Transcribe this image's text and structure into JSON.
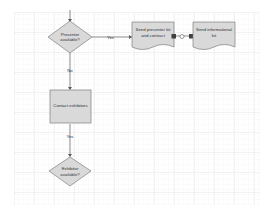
{
  "diagram": {
    "type": "flowchart",
    "nodes": [
      {
        "id": "presenter_available",
        "shape": "decision",
        "label_lines": [
          "Presenter",
          "available?"
        ]
      },
      {
        "id": "send_presenter_kit",
        "shape": "document",
        "label_lines": [
          "Send presenter kit",
          "and contract"
        ]
      },
      {
        "id": "send_informational_kit",
        "shape": "document",
        "label_lines": [
          "Send informational",
          "kit"
        ]
      },
      {
        "id": "contact_exhibitors",
        "shape": "process",
        "label_lines": [
          "Contact exhibitors"
        ]
      },
      {
        "id": "exhibitor_available",
        "shape": "decision",
        "label_lines": [
          "Exhibitor",
          "available?"
        ]
      }
    ],
    "edges": [
      {
        "from": "presenter_available",
        "to": "send_presenter_kit",
        "label": "Yes"
      },
      {
        "from": "send_presenter_kit",
        "to": "send_informational_kit",
        "label": ""
      },
      {
        "from": "presenter_available",
        "to": "contact_exhibitors",
        "label": "No"
      },
      {
        "from": "contact_exhibitors",
        "to": "exhibitor_available",
        "label": "Yes"
      }
    ],
    "colors": {
      "shape_fill": "#d9d9d9",
      "shape_stroke": "#7f7f7f",
      "connector": "#595959",
      "grid_major": "#d4d4d4",
      "grid_minor": "#ececec"
    }
  }
}
